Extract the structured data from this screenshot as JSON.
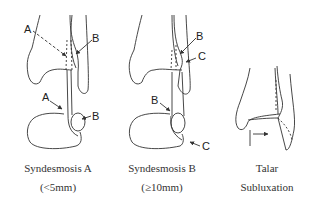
{
  "panels": [
    {
      "id": "syndesmosis-a",
      "caption_line1": "Syndesmosis A",
      "caption_line2": "(<5mm)",
      "labels": {
        "top_left": "A",
        "top_right": "B",
        "bottom_left": "A",
        "bottom_right": "B"
      }
    },
    {
      "id": "syndesmosis-b",
      "caption_line1": "Syndesmosis B",
      "caption_line2": "(≥10mm)",
      "labels": {
        "top_b": "B",
        "top_c": "C",
        "bottom_b": "B",
        "bottom_c": "C"
      }
    },
    {
      "id": "talar-subluxation",
      "caption_line1": "Talar",
      "caption_line2": "Subluxation"
    }
  ],
  "colors": {
    "line": "#333333",
    "background": "#ffffff"
  }
}
